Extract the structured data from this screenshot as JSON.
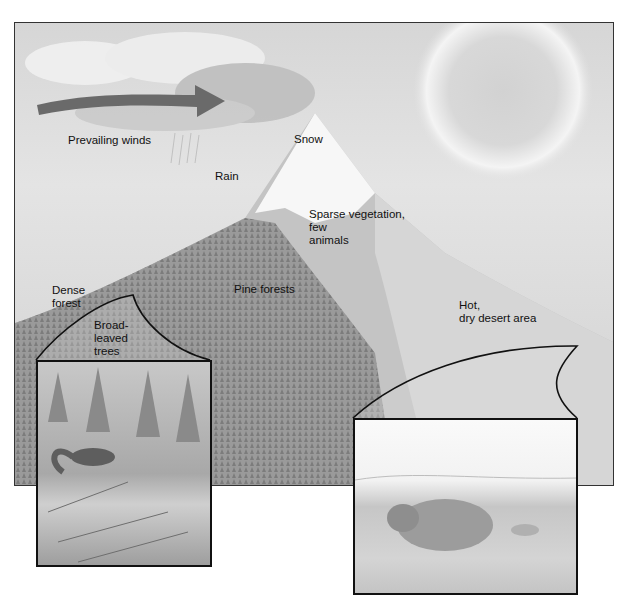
{
  "diagram": {
    "labels": {
      "prevailing_winds": "Prevailing winds",
      "rain": "Rain",
      "snow": "Snow",
      "sparse_vegetation": "Sparse vegetation,\nfew\nanimals",
      "pine_forests": "Pine forests",
      "dense_forest": "Dense\nforest",
      "broad_leaved_trees": "Broad-\nleaved\ntrees",
      "hot_dry_desert": "Hot,\ndry desert area"
    },
    "insets": [
      {
        "name": "forest-inset",
        "depicts": "squirrel in pine forest"
      },
      {
        "name": "desert-inset",
        "depicts": "ground rodent in dry desert"
      }
    ],
    "colors": {
      "arrow": "#6a6a6a",
      "border": "#111111",
      "sky": "#dcdcdc"
    }
  }
}
